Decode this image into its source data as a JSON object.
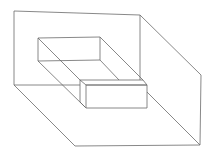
{
  "diagram": {
    "title": "",
    "type": "isometric line drawing",
    "background": "#ffffff",
    "stroke_color": "#6a6a6a",
    "shapes": [
      {
        "name": "back-wall",
        "points": "14,11 140,15 140,80"
      },
      {
        "name": "back-wall-left-edge",
        "points": "14,11 14,85"
      },
      {
        "name": "wall-floor-edge",
        "points": "14,85 80,85"
      },
      {
        "name": "side-wall-top",
        "points": "140,15 201,75 200,145"
      },
      {
        "name": "floor-left-edge",
        "points": "14,85 75,146 200,145"
      },
      {
        "name": "recess-rect",
        "points": "38,38 100,37 100,60 38,61 38,38"
      },
      {
        "name": "recess-diag-top-left",
        "points": "38,38 80,80"
      },
      {
        "name": "recess-diag-bottom-left",
        "points": "38,61 85,107"
      },
      {
        "name": "recess-diag-top-right",
        "points": "100,37 143,80"
      },
      {
        "name": "recess-diag-bottom-right",
        "points": "100,60 119,80"
      },
      {
        "name": "box-top",
        "points": "80,80 143,80 147,85 86,85 80,80"
      },
      {
        "name": "box-front",
        "points": "86,85 147,85 147,108 86,108 86,85"
      },
      {
        "name": "box-left",
        "points": "80,80 80,102 86,108"
      },
      {
        "name": "box-to-corner",
        "points": "147,92 200,145"
      }
    ]
  }
}
